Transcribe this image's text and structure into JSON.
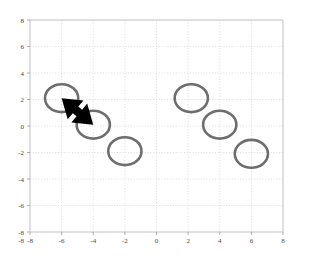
{
  "chart_data": {
    "type": "scatter",
    "title": "",
    "subtitle": "",
    "xlabel": "",
    "ylabel": "",
    "xlim": [
      -8,
      8
    ],
    "ylim": [
      -8,
      8
    ],
    "grid": true,
    "legend": null,
    "legend_position": "none",
    "marker": {
      "style": "open-circle",
      "radius_data_units": 1.05,
      "edge_color": "#6e6e6e",
      "face_color": "none",
      "edge_width_px": 2.6
    },
    "xticks": [
      -8,
      -6,
      -4,
      -2,
      0,
      2,
      4,
      6,
      8
    ],
    "yticks": [
      -8,
      -6,
      -4,
      -2,
      0,
      2,
      4,
      6,
      8
    ],
    "xtick_labels": [
      "-8",
      "-6",
      "-4",
      "-2",
      "0",
      "2",
      "4",
      "6",
      "8"
    ],
    "ytick_labels": [
      "-8",
      "-6",
      "-4",
      "-2",
      "0",
      "2",
      "4",
      "6",
      "8"
    ],
    "series": [
      {
        "name": "left-group",
        "points": [
          {
            "x": -6.0,
            "y": 2.1
          },
          {
            "x": -4.0,
            "y": 0.1
          },
          {
            "x": -2.0,
            "y": -1.9
          }
        ]
      },
      {
        "name": "right-group",
        "points": [
          {
            "x": 2.2,
            "y": 2.1
          },
          {
            "x": 4.0,
            "y": 0.1
          },
          {
            "x": 6.0,
            "y": -2.1
          }
        ]
      }
    ],
    "annotations": [
      {
        "kind": "double-headed-arrow",
        "color": "#000000",
        "from": {
          "x": -6.0,
          "y": 2.1
        },
        "to": {
          "x": -4.0,
          "y": 0.1
        },
        "shaft_width_data_units": 0.55,
        "head_length_data_units": 1.15,
        "head_width_data_units": 1.55
      }
    ]
  },
  "axes": {
    "x_tick_labels": [
      "-8",
      "-6",
      "-4",
      "-2",
      "0",
      "2",
      "4",
      "6",
      "8"
    ],
    "y_tick_labels": [
      "8",
      "6",
      "4",
      "2",
      "0",
      "-2",
      "-4",
      "-6",
      "-8"
    ],
    "corner_label": "-8"
  }
}
